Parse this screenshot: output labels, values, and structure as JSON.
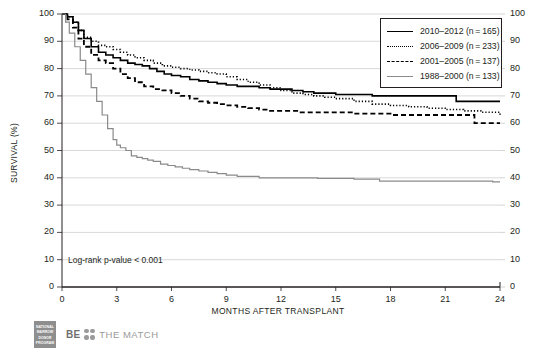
{
  "chart_data": {
    "type": "line",
    "title": "",
    "xlabel": "MONTHS AFTER TRANSPLANT",
    "ylabel": "SURVIVAL (%)",
    "xlim": [
      0,
      24
    ],
    "ylim": [
      0,
      100
    ],
    "xticks": [
      "0",
      "3",
      "6",
      "9",
      "12",
      "15",
      "18",
      "21",
      "24"
    ],
    "yticks": [
      "0",
      "10",
      "20",
      "30",
      "40",
      "50",
      "60",
      "70",
      "80",
      "90",
      "100"
    ],
    "grid": "horizontal",
    "legend_position": "top-right",
    "annotation": "Log-rank p-value < 0.001",
    "series": [
      {
        "name": "2010–2012 (n = 165)",
        "style": "solid",
        "color": "#000000",
        "x": [
          0,
          0.3,
          0.6,
          0.9,
          1.2,
          1.6,
          2.0,
          2.4,
          2.8,
          3.2,
          3.6,
          4.0,
          4.4,
          4.8,
          5.2,
          5.6,
          6.0,
          6.5,
          7.0,
          7.5,
          8.0,
          8.5,
          9.0,
          9.6,
          10.2,
          10.8,
          11.4,
          12.0,
          12.6,
          13.2,
          13.8,
          14.4,
          15.0,
          16.0,
          17.0,
          18.0,
          19.0,
          20.0,
          21.0,
          21.6,
          22.0,
          23.0,
          24.0
        ],
        "y": [
          100,
          99,
          97,
          94,
          91,
          88,
          86,
          85,
          84,
          83,
          82,
          81.5,
          81,
          80,
          79,
          78,
          77.5,
          77,
          76,
          75.5,
          75,
          74.5,
          74,
          73.5,
          73.5,
          73,
          72.5,
          72.5,
          72,
          71.5,
          71,
          71,
          70.5,
          70.5,
          70,
          70,
          70,
          70,
          70,
          68,
          68,
          68,
          68
        ]
      },
      {
        "name": "2006–2009 (n = 233)",
        "style": "dotted",
        "color": "#000000",
        "x": [
          0,
          0.3,
          0.6,
          0.9,
          1.2,
          1.6,
          2.0,
          2.4,
          2.8,
          3.2,
          3.6,
          4.0,
          4.5,
          5.0,
          5.5,
          6.0,
          6.5,
          7.0,
          7.5,
          8.0,
          8.5,
          9.0,
          9.6,
          10.2,
          10.8,
          11.4,
          12.0,
          12.6,
          13.2,
          13.8,
          14.4,
          15.0,
          16.0,
          17.0,
          18.0,
          19.0,
          20.0,
          21.0,
          22.0,
          23.0,
          24.0
        ],
        "y": [
          100,
          99,
          97,
          94,
          91.5,
          90,
          88.5,
          88,
          87,
          86,
          85,
          84,
          83,
          82,
          81,
          80.5,
          80,
          79.5,
          79,
          78.5,
          78,
          77,
          76,
          75,
          74,
          73,
          72,
          71,
          70.5,
          70,
          69.5,
          69,
          68,
          67,
          66.5,
          66,
          65.5,
          65,
          64.5,
          64,
          63
        ]
      },
      {
        "name": "2001–2005 (n = 137)",
        "style": "dashed",
        "color": "#000000",
        "x": [
          0,
          0.3,
          0.6,
          0.9,
          1.2,
          1.6,
          2.0,
          2.4,
          2.8,
          3.2,
          3.6,
          4.0,
          4.5,
          5.0,
          5.5,
          6.0,
          6.5,
          7.0,
          7.5,
          8.0,
          8.5,
          9.0,
          9.6,
          10.2,
          10.8,
          11.4,
          12.0,
          13.0,
          14.0,
          15.0,
          16.0,
          17.0,
          18.0,
          19.0,
          20.0,
          21.0,
          22.0,
          22.6,
          23.0,
          24.0
        ],
        "y": [
          100,
          98,
          95,
          91,
          88,
          85,
          83,
          82,
          80,
          78,
          76.5,
          75,
          73.5,
          72.5,
          72,
          71,
          70,
          69,
          68,
          67.5,
          67,
          66.5,
          66,
          65.5,
          65,
          64.5,
          64.5,
          64,
          64,
          64,
          63.5,
          63.5,
          63,
          63,
          63,
          63,
          63,
          60,
          60,
          60
        ]
      },
      {
        "name": "1988–2000 (n = 133)",
        "style": "solid",
        "color": "#8a8a8a",
        "x": [
          0,
          0.2,
          0.4,
          0.7,
          1.0,
          1.3,
          1.6,
          1.9,
          2.2,
          2.5,
          2.8,
          3.0,
          3.2,
          3.5,
          3.8,
          4.1,
          4.4,
          4.7,
          5.0,
          5.4,
          5.8,
          6.2,
          6.6,
          7.0,
          7.5,
          8.0,
          8.5,
          9.0,
          9.6,
          10.2,
          10.8,
          11.4,
          12.0,
          12.6,
          13.2,
          14.0,
          15.0,
          16.0,
          17.0,
          17.4,
          18.0,
          19.0,
          20.0,
          21.0,
          22.0,
          23.0,
          23.6,
          24.0
        ],
        "y": [
          100,
          97,
          93,
          88,
          83,
          78,
          73,
          68,
          63,
          58,
          54,
          52,
          51,
          50,
          48,
          47.5,
          47,
          46.5,
          46,
          45,
          44.5,
          44,
          43.5,
          43,
          42.5,
          42,
          41.5,
          41,
          40.5,
          40.5,
          40,
          40,
          40,
          40,
          40,
          39.8,
          39.8,
          39.5,
          39.5,
          38.8,
          38.8,
          38.8,
          38.8,
          38.8,
          38.8,
          38.8,
          38.5,
          38.5
        ]
      }
    ]
  },
  "legend": {
    "items": [
      {
        "label": "2010–2012 (n = 165)",
        "style": "solid"
      },
      {
        "label": "2006–2009 (n = 233)",
        "style": "dotted"
      },
      {
        "label": "2001–2005 (n = 137)",
        "style": "dashed"
      },
      {
        "label": "1988–2000 (n = 133)",
        "style": "gray"
      }
    ]
  },
  "footer": {
    "nmdp_lines": [
      "NATIONAL",
      "MARROW",
      "DONOR",
      "PROGRAM"
    ],
    "be_text": "BE",
    "match_text": "THE MATCH"
  }
}
